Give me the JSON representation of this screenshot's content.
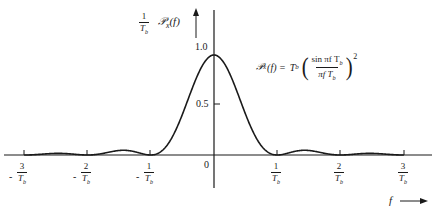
{
  "chart_data": {
    "type": "line",
    "title": "",
    "xlabel": "f",
    "ylabel": "(1/T_b) 𝒫_x(f)",
    "x_ticks": [
      "-3/T_b",
      "-2/T_b",
      "-1/T_b",
      "0",
      "1/T_b",
      "2/T_b",
      "3/T_b"
    ],
    "x_tick_values": [
      -3,
      -2,
      -1,
      0,
      1,
      2,
      3
    ],
    "y_ticks": [
      "0.5",
      "1.0"
    ],
    "y_tick_values": [
      0.5,
      1.0
    ],
    "xlim": [
      -3.2,
      3.4
    ],
    "ylim": [
      0,
      1.1
    ],
    "grid": false,
    "legend": null,
    "annotation": "𝒫_x(f) = T_b (sin πf T_b / πf T_b)^2",
    "series": [
      {
        "name": "(1/T_b) 𝒫_x(f) = sinc²(f T_b)",
        "function": "(sin(pi*x)/(pi*x))^2, x = f*T_b",
        "x": [
          -3,
          -2.5,
          -2,
          -1.5,
          -1,
          -0.75,
          -0.5,
          -0.25,
          0,
          0.25,
          0.5,
          0.75,
          1,
          1.5,
          2,
          2.5,
          3
        ],
        "y": [
          0,
          0.016,
          0,
          0.045,
          0,
          0.18,
          0.405,
          0.811,
          1.0,
          0.811,
          0.405,
          0.18,
          0,
          0.045,
          0,
          0.016,
          0
        ]
      }
    ]
  },
  "labels": {
    "y_axis": {
      "prefix_num": "1",
      "prefix_den": "T",
      "prefix_den_sub": "b",
      "symbol": "𝒫",
      "symbol_sub": "x",
      "arg": "(f)"
    },
    "y_tick_1": "1.0",
    "y_tick_05": "0.5",
    "origin": "0",
    "x_axis_label": "f",
    "x_tick_num": [
      "3",
      "2",
      "1",
      "1",
      "2",
      "3"
    ],
    "x_tick_den": "T",
    "x_tick_den_sub": "b",
    "neg_sign": "-",
    "formula": {
      "lhs_symbol": "𝒫",
      "lhs_sub": "x",
      "lhs_arg": "(f) =",
      "coef": "T",
      "coef_sub": "b",
      "open": "(",
      "num": "sin πf T",
      "num_sub": "b",
      "den": "πf T",
      "den_sub": "b",
      "close": ")",
      "power": "2"
    }
  },
  "colors": {
    "line": "#1a1a1a",
    "background": "#ffffff"
  }
}
